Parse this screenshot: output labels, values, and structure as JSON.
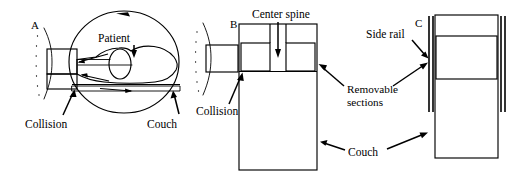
{
  "figure": {
    "background_color": "#ffffff",
    "line_color": "#000000",
    "hatch_color": "#9a9a9a"
  },
  "panels": [
    {
      "id": "A",
      "letter": "A",
      "view": "lateral",
      "labels": {
        "patient": "Patient",
        "collision": "Collision",
        "couch": "Couch"
      }
    },
    {
      "id": "B",
      "letter": "B",
      "view": "top",
      "labels": {
        "center_spine": "Center spine",
        "collision": "Collision",
        "removable_sections": "Removable\nsections",
        "removable_sections_line1": "Removable",
        "removable_sections_line2": "sections",
        "couch": "Couch"
      }
    },
    {
      "id": "C",
      "letter": "C",
      "view": "top",
      "labels": {
        "side_rail": "Side rail",
        "removable_sections_line1": "Removable",
        "removable_sections_line2": "sections",
        "couch": "Couch"
      }
    }
  ],
  "shared_labels": {
    "removable_sections_line1": "Removable",
    "removable_sections_line2": "sections",
    "couch": "Couch"
  }
}
